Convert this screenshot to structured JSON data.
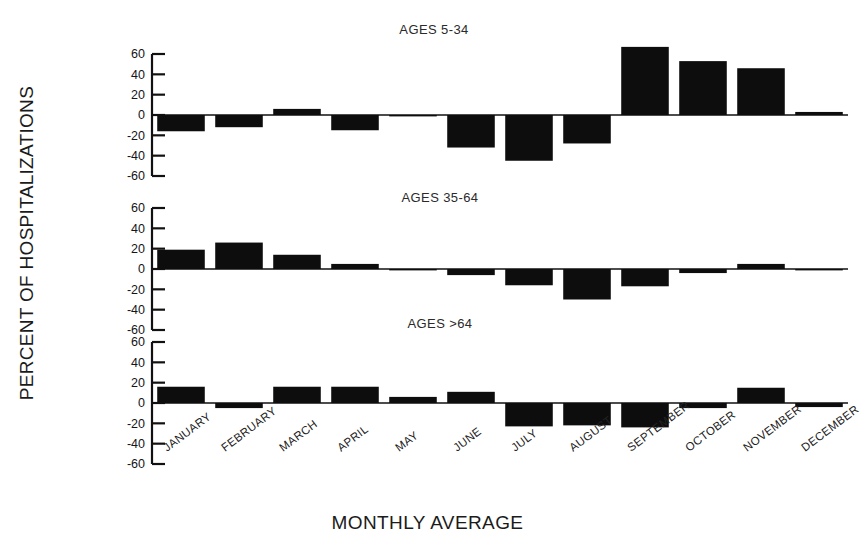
{
  "chart_data": {
    "type": "bar",
    "title": "",
    "xlabel": "MONTHLY AVERAGE",
    "ylabel": "PERCENT OF HOSPITALIZATIONS",
    "categories": [
      "JANUARY",
      "FEBRUARY",
      "MARCH",
      "APRIL",
      "MAY",
      "JUNE",
      "JULY",
      "AUGUST",
      "SEPTEMBER",
      "OCTOBER",
      "NOVEMBER",
      "DECEMBER"
    ],
    "ylim": [
      -60,
      60
    ],
    "yticks": [
      60,
      40,
      20,
      0,
      -20,
      -40,
      -60
    ],
    "ytick_labels": [
      "60",
      "40",
      "20",
      "0",
      "-20",
      "-40",
      "-60"
    ],
    "grid": false,
    "legend": "none",
    "bar_color": "#0d0d0d",
    "axis_color": "#111111",
    "panels": [
      {
        "title": "AGES 5-34",
        "values": [
          -16,
          -12,
          6,
          -15,
          0,
          -32,
          -45,
          -28,
          67,
          53,
          46,
          3
        ]
      },
      {
        "title": "AGES 35-64",
        "values": [
          19,
          26,
          14,
          5,
          0,
          -6,
          -16,
          -30,
          -17,
          -4,
          5,
          0
        ]
      },
      {
        "title": "AGES >64",
        "values": [
          16,
          -5,
          16,
          16,
          6,
          11,
          -23,
          -22,
          -24,
          -5,
          15,
          -4
        ]
      }
    ]
  }
}
